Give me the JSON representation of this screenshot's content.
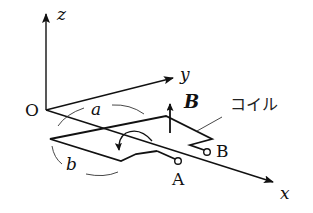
{
  "diagram": {
    "type": "physics-coil-in-magnetic-field",
    "axes": {
      "origin_label": "O",
      "x_label": "x",
      "y_label": "y",
      "z_label": "z"
    },
    "dimensions": {
      "side_a": "a",
      "side_b": "b"
    },
    "field": {
      "label": "B"
    },
    "coil": {
      "label": "コイル",
      "terminal_a": "A",
      "terminal_b": "B"
    },
    "colors": {
      "line": "#111111",
      "background": "#ffffff"
    }
  }
}
